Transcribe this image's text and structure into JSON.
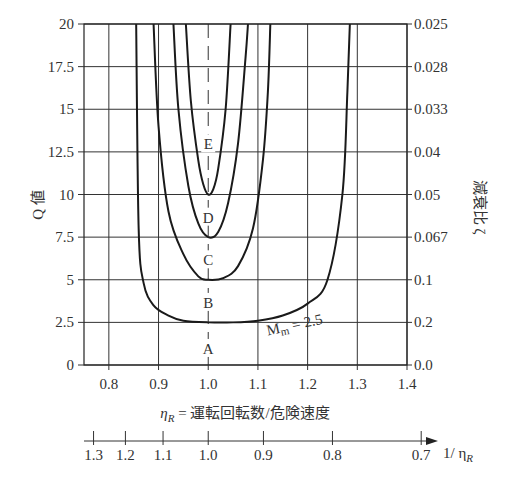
{
  "chart_data": {
    "type": "line",
    "title": "",
    "xlabel": "η_R = 運転回転数/危険速度",
    "ylabel": "Q 値",
    "ylabel_right": "減衰比 ζ",
    "xlim": [
      0.75,
      1.4
    ],
    "ylim": [
      0,
      20
    ],
    "grid": true,
    "x_ticks": [
      "0.8",
      "0.9",
      "1.0",
      "1.1",
      "1.2",
      "1.3",
      "1.4"
    ],
    "y_ticks": [
      "0",
      "2.5",
      "5",
      "7.5",
      "10",
      "12.5",
      "15",
      "17.5",
      "20"
    ],
    "y_right_ticks": [
      "0.0",
      "0.2",
      "0.1",
      "0.067",
      "0.05",
      "0.04",
      "0.033",
      "0.028",
      "0.025"
    ],
    "secondary_x_axis": {
      "label": "1/ η_R",
      "ticks": [
        "1.3",
        "1.2",
        "1.1",
        "1.0",
        "0.9",
        "0.8",
        "0.7"
      ]
    },
    "series": [
      {
        "name": "M_m = 2.5",
        "min_q": 2.5,
        "x_left_asymptote": 0.855,
        "x_right_asymptote": 1.285,
        "x": [
          0.855,
          0.86,
          0.87,
          0.89,
          0.92,
          0.95,
          1.0,
          1.05,
          1.1,
          1.15,
          1.2,
          1.24,
          1.27,
          1.28,
          1.285
        ],
        "y": [
          20,
          8,
          4.8,
          3.5,
          2.9,
          2.6,
          2.5,
          2.5,
          2.6,
          2.9,
          3.6,
          5,
          10,
          16,
          20
        ]
      },
      {
        "name": "C",
        "min_q": 5,
        "x_left_asymptote": 0.89,
        "x_right_asymptote": 1.125,
        "x": [
          0.89,
          0.9,
          0.92,
          0.95,
          0.98,
          1.0,
          1.03,
          1.06,
          1.09,
          1.11,
          1.12,
          1.125
        ],
        "y": [
          20,
          14,
          9,
          6.5,
          5.2,
          5,
          5.1,
          5.8,
          8,
          12,
          16,
          20
        ]
      },
      {
        "name": "D",
        "min_q": 7.5,
        "x_left_asymptote": 0.93,
        "x_right_asymptote": 1.08,
        "x": [
          0.93,
          0.94,
          0.96,
          0.98,
          1.0,
          1.02,
          1.04,
          1.06,
          1.075,
          1.08
        ],
        "y": [
          20,
          15,
          10.5,
          8.3,
          7.5,
          7.8,
          9.5,
          13,
          18,
          20
        ]
      },
      {
        "name": "E",
        "min_q": 10,
        "x_left_asymptote": 0.955,
        "x_right_asymptote": 1.045,
        "x": [
          0.955,
          0.965,
          0.98,
          0.99,
          1.0,
          1.01,
          1.02,
          1.035,
          1.045
        ],
        "y": [
          20,
          15.5,
          12,
          10.6,
          10,
          10.3,
          11.5,
          15,
          20
        ]
      }
    ],
    "annotations": [
      {
        "text": "A",
        "x": 1.0,
        "y": 1.0
      },
      {
        "text": "B",
        "x": 1.0,
        "y": 3.7
      },
      {
        "text": "C",
        "x": 1.0,
        "y": 6.2
      },
      {
        "text": "D",
        "x": 1.0,
        "y": 8.7
      },
      {
        "text": "E",
        "x": 1.0,
        "y": 13.0
      },
      {
        "text": "M_m = 2.5",
        "x": 1.12,
        "y": 2.2
      }
    ]
  },
  "labels": {
    "y_left_title": "Q 値",
    "y_right_title": "減衰比 ζ",
    "x_title_eta": "η",
    "x_title_sub": "R",
    "x_title_rest": " = 運転回転数/危険速度",
    "x2_title_prefix": "1/ η",
    "x2_title_sub": "R",
    "mm_label_main": "M",
    "mm_label_sub": "m",
    "mm_label_rest": " = 2.5"
  }
}
